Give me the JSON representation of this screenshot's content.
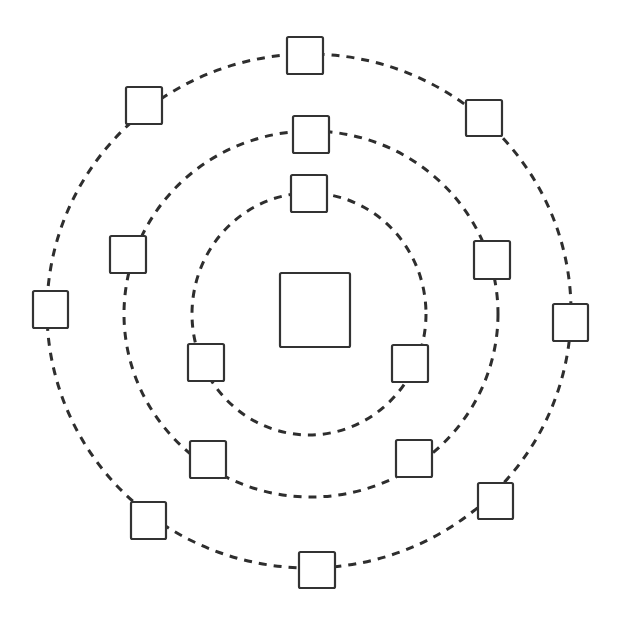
{
  "diagram": {
    "title": "",
    "type": "concentric-rings",
    "colors": {
      "background": "#ffffff",
      "stroke": "#333333",
      "node_fill": "#ffffff"
    },
    "center_node": {
      "x": 280,
      "y": 273,
      "w": 70,
      "h": 74,
      "label": ""
    },
    "rings": [
      {
        "name": "inner",
        "cx": 309,
        "cy": 314,
        "rx": 117,
        "ry": 121,
        "nodes": [
          {
            "x": 291,
            "y": 175,
            "w": 36,
            "h": 37,
            "label": ""
          },
          {
            "x": 188,
            "y": 344,
            "w": 36,
            "h": 37,
            "label": ""
          },
          {
            "x": 392,
            "y": 345,
            "w": 36,
            "h": 37,
            "label": ""
          }
        ]
      },
      {
        "name": "middle",
        "cx": 311,
        "cy": 314,
        "rx": 187,
        "ry": 183,
        "nodes": [
          {
            "x": 293,
            "y": 116,
            "w": 36,
            "h": 37,
            "label": ""
          },
          {
            "x": 110,
            "y": 236,
            "w": 36,
            "h": 37,
            "label": ""
          },
          {
            "x": 474,
            "y": 241,
            "w": 36,
            "h": 38,
            "label": ""
          },
          {
            "x": 190,
            "y": 441,
            "w": 36,
            "h": 37,
            "label": ""
          },
          {
            "x": 396,
            "y": 440,
            "w": 36,
            "h": 37,
            "label": ""
          }
        ]
      },
      {
        "name": "outer",
        "cx": 309,
        "cy": 311,
        "rx": 262,
        "ry": 257,
        "nodes": [
          {
            "x": 287,
            "y": 37,
            "w": 36,
            "h": 37,
            "label": ""
          },
          {
            "x": 126,
            "y": 87,
            "w": 36,
            "h": 37,
            "label": ""
          },
          {
            "x": 466,
            "y": 100,
            "w": 36,
            "h": 36,
            "label": ""
          },
          {
            "x": 33,
            "y": 291,
            "w": 35,
            "h": 37,
            "label": ""
          },
          {
            "x": 553,
            "y": 304,
            "w": 35,
            "h": 37,
            "label": ""
          },
          {
            "x": 131,
            "y": 502,
            "w": 35,
            "h": 37,
            "label": ""
          },
          {
            "x": 478,
            "y": 483,
            "w": 35,
            "h": 36,
            "label": ""
          },
          {
            "x": 299,
            "y": 552,
            "w": 36,
            "h": 36,
            "label": ""
          }
        ]
      }
    ]
  }
}
